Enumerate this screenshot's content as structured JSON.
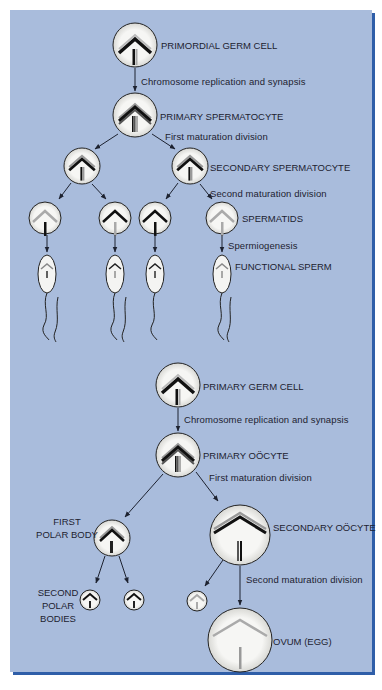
{
  "diagram": {
    "panel_colors": {
      "background": "#a9bcdc",
      "shadow": "#2f5ea8",
      "cell_fill": "#f4f4f2",
      "ink": "#1d2230"
    },
    "spermatogenesis": {
      "stages": [
        {
          "id": "primordial",
          "label": "PRIMORDIAL GERM CELL"
        },
        {
          "id": "primary-spermatocyte",
          "label": "PRIMARY SPERMATOCYTE"
        },
        {
          "id": "secondary-spermatocyte",
          "label": "SECONDARY SPERMATOCYTE"
        },
        {
          "id": "spermatids",
          "label": "SPERMATIDS"
        },
        {
          "id": "functional-sperm",
          "label": "FUNCTIONAL SPERM"
        }
      ],
      "processes": [
        {
          "id": "replication",
          "label": "Chromosome replication and synapsis"
        },
        {
          "id": "first-division",
          "label": "First maturation division"
        },
        {
          "id": "second-division",
          "label": "Second maturation division"
        },
        {
          "id": "spermiogenesis",
          "label": "Spermiogenesis"
        }
      ]
    },
    "oogenesis": {
      "stages": [
        {
          "id": "primary-germ",
          "label": "PRIMARY GERM CELL"
        },
        {
          "id": "primary-oocyte",
          "label": "PRIMARY OÖCYTE"
        },
        {
          "id": "first-polar-body",
          "label_lines": [
            "FIRST",
            "POLAR BODY"
          ]
        },
        {
          "id": "secondary-oocyte",
          "label": "SECONDARY OÖCYTE"
        },
        {
          "id": "second-polar-bodies",
          "label_lines": [
            "SECOND",
            "POLAR",
            "BODIES"
          ]
        },
        {
          "id": "ovum",
          "label": "OVUM (EGG)"
        }
      ],
      "processes": [
        {
          "id": "replication",
          "label": "Chromosome replication and synapsis"
        },
        {
          "id": "first-division",
          "label": "First maturation division"
        },
        {
          "id": "second-division",
          "label": "Second maturation division"
        }
      ]
    }
  }
}
